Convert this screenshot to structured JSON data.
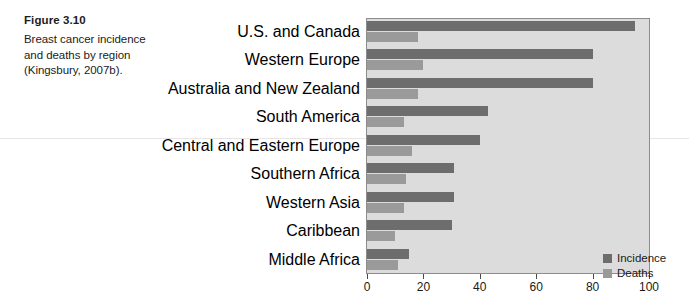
{
  "figure": {
    "number": "Figure 3.10",
    "caption_lines": [
      "Breast cancer incidence",
      "and deaths by region",
      "(Kingsbury, 2007b)."
    ]
  },
  "legend": {
    "incidence_label": "Incidence",
    "deaths_label": "Deaths",
    "incidence_color": "#6d6d6d",
    "deaths_color": "#9a9a9a"
  },
  "chart_data": {
    "type": "bar",
    "orientation": "horizontal",
    "title": "",
    "xlabel": "",
    "ylabel": "",
    "xlim": [
      0,
      100
    ],
    "xticks": [
      0,
      20,
      40,
      60,
      80,
      100
    ],
    "xtick_labels": [
      "0",
      "20",
      "40",
      "60",
      "80",
      "100"
    ],
    "grid": false,
    "legend_position": "bottom-right",
    "plot_background": "#dcdcdc",
    "categories": [
      "U.S. and Canada",
      "Western Europe",
      "Australia and New Zealand",
      "South America",
      "Central and Eastern Europe",
      "Southern Africa",
      "Western Asia",
      "Caribbean",
      "Middle Africa"
    ],
    "series": [
      {
        "name": "Incidence",
        "color": "#6d6d6d",
        "values": [
          95,
          80,
          80,
          43,
          40,
          31,
          31,
          30,
          15
        ]
      },
      {
        "name": "Deaths",
        "color": "#9a9a9a",
        "values": [
          18,
          20,
          18,
          13,
          16,
          14,
          13,
          10,
          11
        ]
      }
    ]
  }
}
